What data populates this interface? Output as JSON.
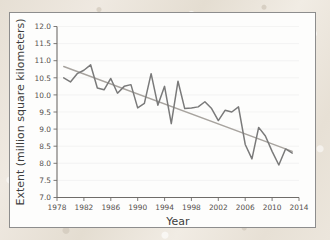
{
  "figure": {
    "card_background": "#fdfdfc",
    "border_color": "#8d8d8d"
  },
  "chart_data": {
    "type": "line",
    "title": "",
    "xlabel": "Year",
    "ylabel": "Extent (million square kilometers)",
    "xlim": [
      1978,
      2014
    ],
    "ylim": [
      7.0,
      12.0
    ],
    "xticks": [
      1978,
      1982,
      1986,
      1990,
      1994,
      1998,
      2002,
      2006,
      2010,
      2014
    ],
    "xtick_labels": [
      "1978",
      "1982",
      "1986",
      "1990",
      "1994",
      "1998",
      "2002",
      "2006",
      "2010",
      "2014"
    ],
    "yticks": [
      7.0,
      7.5,
      8.0,
      8.5,
      9.0,
      9.5,
      10.0,
      10.5,
      11.0,
      11.5,
      12.0
    ],
    "ytick_labels": [
      "7.0",
      "7.5",
      "8.0",
      "8.5",
      "9.0",
      "9.5",
      "10.0",
      "10.5",
      "11.0",
      "11.5",
      "12.0"
    ],
    "grid": true,
    "legend": "none",
    "series": [
      {
        "name": "Sea ice extent",
        "kind": "line",
        "color": "#7a7a7a",
        "x": [
          1979,
          1980,
          1981,
          1982,
          1983,
          1984,
          1985,
          1986,
          1987,
          1988,
          1989,
          1990,
          1991,
          1992,
          1993,
          1994,
          1995,
          1996,
          1997,
          1998,
          1999,
          2000,
          2001,
          2002,
          2003,
          2004,
          2005,
          2006,
          2007,
          2008,
          2009,
          2010,
          2011,
          2012,
          2013
        ],
        "values": [
          10.5,
          10.38,
          10.62,
          10.72,
          10.88,
          10.2,
          10.15,
          10.48,
          10.05,
          10.25,
          10.3,
          9.62,
          9.75,
          10.62,
          9.7,
          10.25,
          9.16,
          10.4,
          9.6,
          9.62,
          9.65,
          9.8,
          9.6,
          9.25,
          9.55,
          9.5,
          9.65,
          8.55,
          8.13,
          9.05,
          8.8,
          8.35,
          7.95,
          8.42,
          8.3
        ]
      },
      {
        "name": "Linear trend",
        "kind": "trend",
        "color": "#a8a49f",
        "x": [
          1979,
          2013
        ],
        "values": [
          10.83,
          8.35
        ]
      }
    ]
  }
}
